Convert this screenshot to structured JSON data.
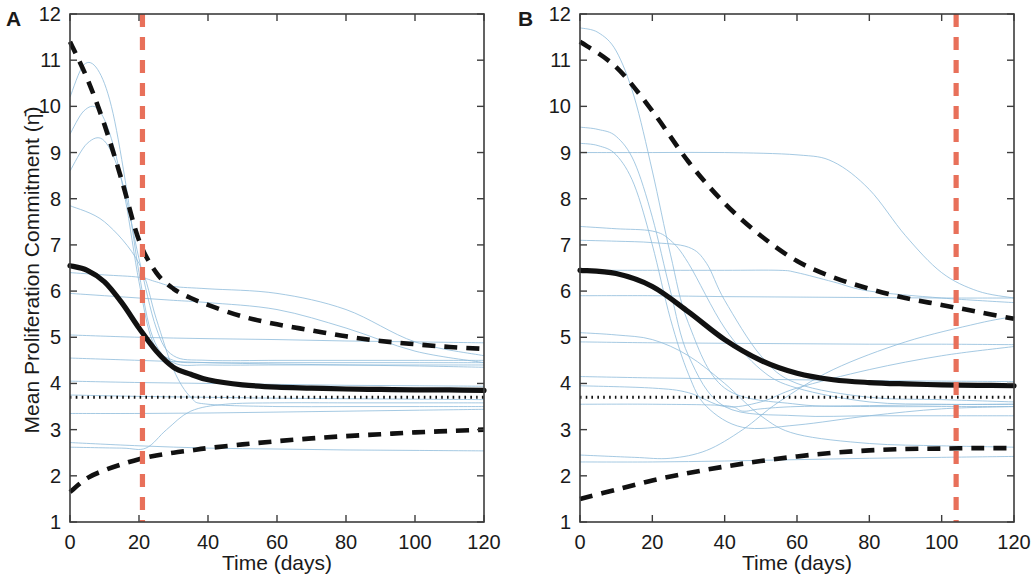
{
  "figure": {
    "background_color": "#ffffff",
    "panel_count": 2
  },
  "panels": [
    {
      "letter": "A",
      "ylabel": "Mean Proliferation Commitment (η̄)",
      "xlabel": "Time (days)"
    },
    {
      "letter": "B",
      "ylabel": "Mean Proliferation Commitment (η̄)",
      "xlabel": "Time (days)"
    }
  ],
  "axis": {
    "x_ticks": [
      "0",
      "20",
      "40",
      "60",
      "80",
      "100",
      "120"
    ],
    "y_ticks": [
      "1",
      "2",
      "3",
      "4",
      "5",
      "6",
      "7",
      "8",
      "9",
      "10",
      "11",
      "12"
    ]
  },
  "colors": {
    "mean_curve": "#111111",
    "confidence_band": "#111111",
    "threshold_line": "#111111",
    "marker_line": "#e8705a",
    "trajectory": "#8fbcdb",
    "axis": "#3d3d3d",
    "text": "#1a1a1a"
  },
  "chart_data": [
    {
      "type": "line",
      "panel": "A",
      "title": "",
      "xlabel": "Time (days)",
      "ylabel": "Mean Proliferation Commitment (η̄)",
      "xlim": [
        0,
        120
      ],
      "ylim": [
        1,
        12
      ],
      "xticks": [
        0,
        20,
        40,
        60,
        80,
        100,
        120
      ],
      "yticks": [
        1,
        2,
        3,
        4,
        5,
        6,
        7,
        8,
        9,
        10,
        11,
        12
      ],
      "grid": false,
      "legend": "none",
      "x": [
        0,
        5,
        10,
        15,
        20,
        25,
        30,
        35,
        40,
        50,
        60,
        70,
        80,
        90,
        100,
        110,
        120
      ],
      "series": [
        {
          "name": "Mean",
          "style": "solid-thick",
          "color": "#111111",
          "values": [
            6.55,
            6.45,
            6.2,
            5.75,
            5.2,
            4.7,
            4.35,
            4.2,
            4.08,
            3.97,
            3.92,
            3.9,
            3.88,
            3.87,
            3.86,
            3.86,
            3.85
          ]
        },
        {
          "name": "Upper 95% bound",
          "style": "dashed",
          "color": "#111111",
          "values": [
            11.4,
            10.6,
            9.6,
            8.4,
            7.1,
            6.4,
            6.05,
            5.85,
            5.7,
            5.45,
            5.28,
            5.15,
            5.02,
            4.92,
            4.85,
            4.79,
            4.75
          ]
        },
        {
          "name": "Lower 95% bound",
          "style": "dashed",
          "color": "#111111",
          "values": [
            1.65,
            1.95,
            2.12,
            2.25,
            2.36,
            2.44,
            2.5,
            2.55,
            2.6,
            2.68,
            2.75,
            2.81,
            2.86,
            2.9,
            2.94,
            2.97,
            3.0
          ]
        },
        {
          "name": "Threshold",
          "style": "dotted",
          "color": "#111111",
          "values": [
            3.7,
            3.7,
            3.7,
            3.7,
            3.7,
            3.7,
            3.7,
            3.7,
            3.7,
            3.7,
            3.7,
            3.7,
            3.7,
            3.7,
            3.7,
            3.7,
            3.7
          ]
        }
      ],
      "annotations": [
        {
          "type": "vline",
          "x": 21,
          "color": "#e8705a",
          "style": "dashed"
        }
      ],
      "individual_trajectories": [
        {
          "x": [
            0,
            4,
            8,
            12,
            16,
            20,
            24,
            30,
            40,
            60,
            80,
            100,
            120
          ],
          "y": [
            10.2,
            10.9,
            10.8,
            10.0,
            8.4,
            6.4,
            5.0,
            4.45,
            4.4,
            4.4,
            4.4,
            4.4,
            4.4
          ]
        },
        {
          "x": [
            0,
            4,
            8,
            12,
            16,
            20,
            24,
            30,
            40,
            60,
            80,
            100,
            120
          ],
          "y": [
            9.4,
            9.9,
            9.95,
            9.3,
            8.0,
            6.2,
            4.9,
            4.5,
            4.45,
            4.45,
            4.45,
            4.45,
            4.45
          ]
        },
        {
          "x": [
            0,
            5,
            10,
            15,
            20,
            25,
            30,
            40,
            60,
            80,
            100,
            120
          ],
          "y": [
            8.6,
            9.2,
            9.25,
            8.4,
            6.7,
            5.2,
            4.6,
            4.5,
            4.5,
            4.5,
            4.5,
            4.5
          ]
        },
        {
          "x": [
            0,
            10,
            20,
            25,
            30,
            35,
            40,
            60,
            80,
            100,
            120
          ],
          "y": [
            7.85,
            7.5,
            6.6,
            5.4,
            4.3,
            3.7,
            3.55,
            3.5,
            3.5,
            3.5,
            3.5
          ]
        },
        {
          "x": [
            0,
            10,
            20,
            25,
            30,
            40,
            60,
            80,
            100,
            120
          ],
          "y": [
            6.4,
            6.35,
            6.3,
            6.2,
            6.1,
            6.05,
            5.95,
            5.6,
            4.9,
            4.6
          ]
        },
        {
          "x": [
            0,
            20,
            40,
            60,
            80,
            100,
            120
          ],
          "y": [
            5.05,
            5.0,
            4.97,
            4.95,
            4.92,
            4.9,
            4.88
          ]
        },
        {
          "x": [
            0,
            20,
            40,
            60,
            80,
            100,
            120
          ],
          "y": [
            4.55,
            4.5,
            4.45,
            4.42,
            4.4,
            4.38,
            4.35
          ]
        },
        {
          "x": [
            0,
            20,
            40,
            60,
            80,
            100,
            120
          ],
          "y": [
            4.05,
            4.02,
            4.0,
            3.98,
            3.96,
            3.95,
            3.94
          ]
        },
        {
          "x": [
            0,
            20,
            40,
            60,
            80,
            100,
            120
          ],
          "y": [
            3.75,
            3.72,
            3.7,
            3.68,
            3.67,
            3.66,
            3.65
          ]
        },
        {
          "x": [
            0,
            20,
            40,
            60,
            80,
            100,
            120
          ],
          "y": [
            3.35,
            3.35,
            3.36,
            3.38,
            3.4,
            3.42,
            3.44
          ]
        },
        {
          "x": [
            0,
            20,
            40,
            60,
            80,
            100,
            120
          ],
          "y": [
            2.72,
            2.65,
            2.6,
            2.58,
            2.56,
            2.55,
            2.54
          ]
        },
        {
          "x": [
            0,
            15,
            22,
            28,
            35,
            45,
            60,
            80,
            100,
            120
          ],
          "y": [
            2.62,
            2.6,
            2.6,
            3.0,
            3.4,
            3.55,
            3.58,
            3.58,
            3.58,
            3.58
          ]
        },
        {
          "x": [
            0,
            10,
            20,
            30,
            40,
            60,
            80,
            100,
            120
          ],
          "y": [
            5.95,
            5.9,
            5.85,
            5.8,
            5.75,
            5.6,
            5.2,
            4.7,
            4.45
          ]
        }
      ]
    },
    {
      "type": "line",
      "panel": "B",
      "title": "",
      "xlabel": "Time (days)",
      "ylabel": "Mean Proliferation Commitment (η̄)",
      "xlim": [
        0,
        120
      ],
      "ylim": [
        1,
        12
      ],
      "xticks": [
        0,
        20,
        40,
        60,
        80,
        100,
        120
      ],
      "yticks": [
        1,
        2,
        3,
        4,
        5,
        6,
        7,
        8,
        9,
        10,
        11,
        12
      ],
      "grid": false,
      "legend": "none",
      "x": [
        0,
        10,
        20,
        30,
        40,
        50,
        60,
        70,
        80,
        90,
        100,
        110,
        120
      ],
      "series": [
        {
          "name": "Mean",
          "style": "solid-thick",
          "color": "#111111",
          "values": [
            6.45,
            6.38,
            6.1,
            5.55,
            4.95,
            4.5,
            4.22,
            4.08,
            4.02,
            3.99,
            3.97,
            3.96,
            3.95
          ]
        },
        {
          "name": "Upper 95% bound",
          "style": "dashed",
          "color": "#111111",
          "values": [
            11.4,
            10.85,
            9.9,
            8.8,
            7.9,
            7.2,
            6.65,
            6.3,
            6.05,
            5.85,
            5.7,
            5.55,
            5.4
          ]
        },
        {
          "name": "Lower 95% bound",
          "style": "dashed",
          "color": "#111111",
          "values": [
            1.5,
            1.7,
            1.9,
            2.06,
            2.2,
            2.32,
            2.42,
            2.5,
            2.55,
            2.58,
            2.59,
            2.6,
            2.6
          ]
        },
        {
          "name": "Threshold",
          "style": "dotted",
          "color": "#111111",
          "values": [
            3.7,
            3.7,
            3.7,
            3.7,
            3.7,
            3.7,
            3.7,
            3.7,
            3.7,
            3.7,
            3.7,
            3.7,
            3.7
          ]
        }
      ],
      "annotations": [
        {
          "type": "vline",
          "x": 104,
          "color": "#e8705a",
          "style": "dashed"
        }
      ],
      "individual_trajectories": [
        {
          "x": [
            0,
            5,
            10,
            15,
            20,
            25,
            30,
            40,
            60,
            80,
            100,
            120
          ],
          "y": [
            11.7,
            11.6,
            11.2,
            10.2,
            8.6,
            6.8,
            5.3,
            3.9,
            3.55,
            3.5,
            3.5,
            3.5
          ]
        },
        {
          "x": [
            0,
            5,
            10,
            15,
            20,
            25,
            30,
            40,
            60,
            80,
            100,
            120
          ],
          "y": [
            9.55,
            9.5,
            9.35,
            8.8,
            7.6,
            6.0,
            4.6,
            3.5,
            3.3,
            3.3,
            3.3,
            3.3
          ]
        },
        {
          "x": [
            0,
            5,
            10,
            15,
            20,
            25,
            30,
            35,
            45,
            60,
            80,
            100,
            120
          ],
          "y": [
            9.2,
            9.15,
            8.95,
            8.3,
            7.0,
            5.4,
            4.2,
            3.5,
            3.05,
            3.1,
            3.3,
            3.45,
            3.5
          ]
        },
        {
          "x": [
            0,
            20,
            40,
            60,
            70,
            80,
            90,
            100,
            110,
            120
          ],
          "y": [
            9.0,
            9.0,
            9.0,
            8.95,
            8.8,
            8.2,
            7.2,
            6.4,
            6.0,
            5.85
          ]
        },
        {
          "x": [
            0,
            10,
            20,
            25,
            30,
            40,
            50,
            60,
            80,
            100,
            120
          ],
          "y": [
            7.4,
            7.35,
            7.3,
            7.1,
            6.6,
            5.2,
            4.3,
            3.9,
            3.6,
            3.55,
            3.55
          ]
        },
        {
          "x": [
            0,
            10,
            20,
            30,
            35,
            40,
            50,
            60,
            80,
            100,
            120
          ],
          "y": [
            7.1,
            7.08,
            7.05,
            6.95,
            6.6,
            5.8,
            4.6,
            4.0,
            3.7,
            3.65,
            3.6
          ]
        },
        {
          "x": [
            0,
            20,
            40,
            55,
            60,
            70,
            80,
            100,
            120
          ],
          "y": [
            6.45,
            6.45,
            6.45,
            6.45,
            6.4,
            6.2,
            6.0,
            5.85,
            5.75
          ]
        },
        {
          "x": [
            0,
            20,
            40,
            60,
            80,
            100,
            120
          ],
          "y": [
            5.9,
            5.9,
            5.88,
            5.87,
            5.86,
            5.85,
            5.85
          ]
        },
        {
          "x": [
            0,
            20,
            40,
            60,
            80,
            100,
            120
          ],
          "y": [
            4.9,
            4.88,
            4.87,
            4.86,
            4.85,
            4.85,
            4.84
          ]
        },
        {
          "x": [
            0,
            20,
            40,
            60,
            80,
            100,
            120
          ],
          "y": [
            4.15,
            4.12,
            4.1,
            4.08,
            4.06,
            4.05,
            4.04
          ]
        },
        {
          "x": [
            0,
            20,
            30,
            40,
            50,
            60,
            80,
            100,
            120
          ],
          "y": [
            3.95,
            3.9,
            3.8,
            3.5,
            3.6,
            3.9,
            4.3,
            4.6,
            4.8
          ]
        },
        {
          "x": [
            0,
            20,
            40,
            45,
            50,
            60,
            80,
            100,
            120
          ],
          "y": [
            3.55,
            3.55,
            3.52,
            3.4,
            3.45,
            3.5,
            3.52,
            3.54,
            3.55
          ]
        },
        {
          "x": [
            0,
            15,
            25,
            35,
            45,
            55,
            70,
            90,
            110,
            120
          ],
          "y": [
            2.45,
            2.4,
            2.38,
            2.55,
            3.0,
            3.6,
            4.3,
            4.9,
            5.3,
            5.45
          ]
        },
        {
          "x": [
            0,
            20,
            40,
            60,
            80,
            100,
            120
          ],
          "y": [
            2.3,
            2.3,
            2.32,
            2.35,
            2.38,
            2.4,
            2.42
          ]
        },
        {
          "x": [
            0,
            10,
            20,
            30,
            40,
            50,
            60,
            80,
            100,
            120
          ],
          "y": [
            5.1,
            5.05,
            4.95,
            4.6,
            4.0,
            3.3,
            2.9,
            2.7,
            2.65,
            2.62
          ]
        }
      ]
    }
  ]
}
